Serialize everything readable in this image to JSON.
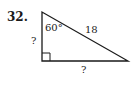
{
  "problem": {
    "number": "32.",
    "angle_label": "60°",
    "hypotenuse_label": "18",
    "vertical_leg_label": "?",
    "horizontal_leg_label": "?"
  }
}
